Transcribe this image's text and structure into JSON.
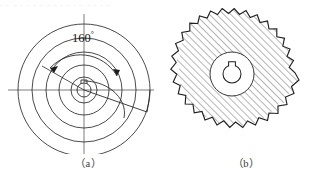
{
  "figure": {
    "background_color": "#ffffff",
    "line_color": "#2b2b2b",
    "hatch_color": "#3a3a3a",
    "top_noise_text": ". . .  .  .   . .  .  .  . . .    . .  .  . .",
    "subfigures": [
      {
        "id": "a",
        "caption": "（a）",
        "kind": "spiral-cam-layout-diagram",
        "center_x": 78,
        "center_y": 82,
        "concentric_circles_radii": [
          13,
          25,
          38,
          52,
          66
        ],
        "centerline_horizontal": true,
        "centerline_vertical": true,
        "dimension": {
          "name": "spiral-wrap-angle",
          "value": "160",
          "unit_symbol": "°",
          "label": "160",
          "arc_radius": 40,
          "arrow_count": 2
        },
        "hub": {
          "bore_radius": 7,
          "keyway": true
        },
        "spiral": {
          "type": "archimedean",
          "start_radius": 9,
          "end_radius": 66,
          "sweep_degrees": 200,
          "riser_step": true
        }
      },
      {
        "id": "b",
        "caption": "（b）",
        "kind": "sectioned-milling-cutter",
        "center_x": 72,
        "center_y": 72,
        "outer_radius": 66,
        "root_radius": 56,
        "tooth_count": 20,
        "hatching": {
          "angle_degrees": 45,
          "spacing_px": 5,
          "direction": "lower-left-to-upper-right"
        },
        "hub": {
          "boss_radius": 22,
          "bore_radius": 9,
          "keyway": true,
          "keyway_position": "top"
        }
      }
    ]
  }
}
